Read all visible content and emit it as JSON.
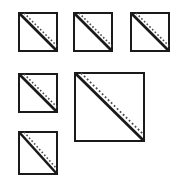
{
  "figure": {
    "title": "Array of squares with diagonal split lines",
    "canvas": {
      "width": 185,
      "height": 192
    },
    "background_color": "#ffffff",
    "stroke_color": "#1a1a1a",
    "dotted_color": "#4a4a4a",
    "fill_color": "#ffffff",
    "count_label": "6"
  },
  "shapes": [
    {
      "id": "square-1",
      "name": "top-left-square",
      "row_label": "row-1",
      "column_label": "column-1",
      "size_label": "small",
      "x": 18,
      "y": 12,
      "width": 40,
      "height": 40,
      "border_width": 2,
      "diagonal_direction": "top-left-to-bottom-right",
      "solid_line_width": 2.6,
      "dotted_line_width": 1.6,
      "dot_dash_pattern": "1.6 2.2",
      "dotted_offset": 5
    },
    {
      "id": "square-2",
      "name": "top-center-square",
      "row_label": "row-1",
      "column_label": "column-2",
      "size_label": "small",
      "x": 73,
      "y": 12,
      "width": 40,
      "height": 40,
      "border_width": 2,
      "diagonal_direction": "top-left-to-bottom-right",
      "solid_line_width": 2.6,
      "dotted_line_width": 1.6,
      "dot_dash_pattern": "1.6 2.2",
      "dotted_offset": 5
    },
    {
      "id": "square-3",
      "name": "top-right-square",
      "row_label": "row-1",
      "column_label": "column-3",
      "size_label": "small",
      "x": 130,
      "y": 12,
      "width": 40,
      "height": 40,
      "border_width": 2,
      "diagonal_direction": "top-left-to-bottom-right",
      "solid_line_width": 2.6,
      "dotted_line_width": 1.6,
      "dot_dash_pattern": "1.6 2.2",
      "dotted_offset": 5
    },
    {
      "id": "square-4",
      "name": "middle-left-square",
      "row_label": "row-2",
      "column_label": "column-1",
      "size_label": "small",
      "x": 18,
      "y": 73,
      "width": 40,
      "height": 40,
      "border_width": 2,
      "diagonal_direction": "top-left-to-bottom-right",
      "solid_line_width": 2.6,
      "dotted_line_width": 1.6,
      "dot_dash_pattern": "1.6 2.2",
      "dotted_offset": 5
    },
    {
      "id": "square-5",
      "name": "center-large-square",
      "row_label": "row-2",
      "column_label": "column-2",
      "size_label": "large",
      "x": 74,
      "y": 72,
      "width": 71,
      "height": 70,
      "border_width": 2,
      "diagonal_direction": "top-left-to-bottom-right",
      "solid_line_width": 2.8,
      "dotted_line_width": 1.8,
      "dot_dash_pattern": "1.8 2.4",
      "dotted_offset": 6
    },
    {
      "id": "square-6",
      "name": "bottom-left-square",
      "row_label": "row-3",
      "column_label": "column-1",
      "size_label": "small",
      "x": 18,
      "y": 131,
      "width": 40,
      "height": 44,
      "border_width": 2,
      "diagonal_direction": "top-left-to-bottom-right",
      "solid_line_width": 2.6,
      "dotted_line_width": 1.6,
      "dot_dash_pattern": "1.6 2.2",
      "dotted_offset": 5
    }
  ]
}
